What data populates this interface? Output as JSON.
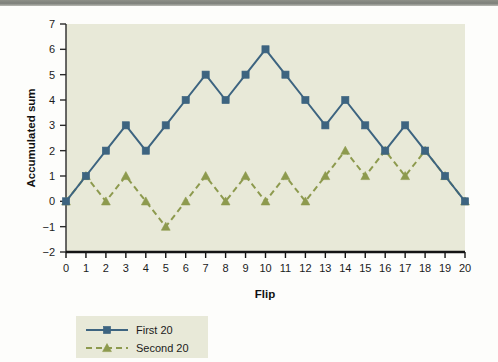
{
  "chart_data": {
    "type": "line",
    "title": "",
    "xlabel": "Flip",
    "ylabel": "Accumulated sum",
    "x": [
      0,
      1,
      2,
      3,
      4,
      5,
      6,
      7,
      8,
      9,
      10,
      11,
      12,
      13,
      14,
      15,
      16,
      17,
      18,
      19,
      20
    ],
    "xlim": [
      0,
      20
    ],
    "ylim": [
      -2,
      7
    ],
    "xticks": [
      "0",
      "1",
      "2",
      "3",
      "4",
      "5",
      "6",
      "7",
      "8",
      "9",
      "10",
      "11",
      "12",
      "13",
      "14",
      "15",
      "16",
      "17",
      "18",
      "19",
      "20"
    ],
    "yticks": [
      "7",
      "6",
      "5",
      "4",
      "3",
      "2",
      "1",
      "0",
      "−1",
      "−2"
    ],
    "grid": false,
    "legend_position": "below-left",
    "plot_background": "#e8e9d8",
    "figure_background": "#fdfdfb",
    "series": [
      {
        "name": "First 20",
        "color": "#3d6480",
        "marker": "square",
        "linestyle": "solid",
        "values": [
          0,
          1,
          2,
          3,
          2,
          3,
          4,
          5,
          4,
          5,
          6,
          5,
          4,
          3,
          4,
          3,
          2,
          3,
          2,
          1,
          0
        ]
      },
      {
        "name": "Second 20",
        "color": "#8d9a4e",
        "marker": "triangle",
        "linestyle": "dashed",
        "values": [
          0,
          1,
          0,
          1,
          0,
          -1,
          0,
          1,
          0,
          1,
          0,
          1,
          0,
          1,
          2,
          1,
          2,
          1,
          2,
          1,
          0
        ]
      }
    ]
  },
  "legend": {
    "entries": [
      {
        "label": "First 20"
      },
      {
        "label": "Second 20"
      }
    ]
  }
}
